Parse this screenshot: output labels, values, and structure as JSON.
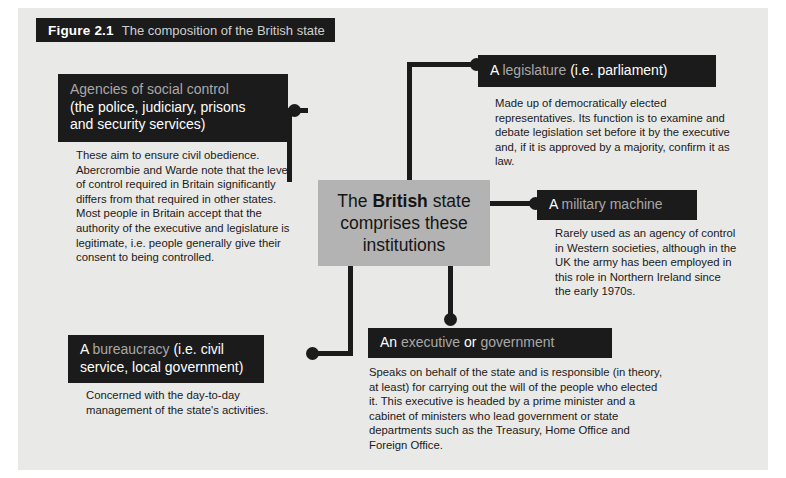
{
  "figure": {
    "number": "Figure 2.1",
    "caption": "The composition of the British state"
  },
  "center": {
    "line1_a": "The ",
    "line1_b": "British",
    "line1_c": " state",
    "line2": "comprises these",
    "line3": "institutions"
  },
  "nodes": [
    {
      "id": "agencies",
      "header_lines": [
        [
          {
            "t": "Agencies of social control",
            "s": "kw"
          }
        ],
        [
          {
            "t": "(the police, judiciary, prisons",
            "s": "wt"
          }
        ],
        [
          {
            "t": "and security services)",
            "s": "wt"
          }
        ]
      ],
      "body": "These aim to ensure civil obedience. Abercrombie and Warde note that the level of control required in Britain significantly differs from that required in other states. Most people in Britain accept that the authority of the executive and legislature is legitimate, i.e. people generally give their consent to being controlled."
    },
    {
      "id": "legislature",
      "header_lines": [
        [
          {
            "t": "A ",
            "s": "wt"
          },
          {
            "t": "legislature",
            "s": "kw"
          },
          {
            "t": " (i.e. parliament)",
            "s": "wt"
          }
        ]
      ],
      "body": "Made up of democratically elected representatives. Its function is to examine and debate legislation set before it by the executive and, if it is approved by a majority, confirm it as law."
    },
    {
      "id": "military",
      "header_lines": [
        [
          {
            "t": "A ",
            "s": "wt"
          },
          {
            "t": "military machine",
            "s": "kw"
          }
        ]
      ],
      "body": "Rarely used as an agency of control in Western societies, although in the UK the army has been employed in this role in Northern Ireland since the early 1970s."
    },
    {
      "id": "executive",
      "header_lines": [
        [
          {
            "t": "An ",
            "s": "wt"
          },
          {
            "t": "executive",
            "s": "kw"
          },
          {
            "t": " or ",
            "s": "wt"
          },
          {
            "t": "government",
            "s": "kw"
          }
        ]
      ],
      "body": "Speaks on behalf of the state and is responsible (in theory, at least) for carrying out the will of the people who elected it. This executive is headed by a prime minister and a cabinet of ministers who lead government or state departments such as the Treasury, Home Office and Foreign Office."
    },
    {
      "id": "bureaucracy",
      "header_lines": [
        [
          {
            "t": "A ",
            "s": "wt"
          },
          {
            "t": "bureaucracy",
            "s": "kw"
          },
          {
            "t": " (i.e. civil",
            "s": "wt"
          }
        ],
        [
          {
            "t": "service, local government)",
            "s": "wt"
          }
        ]
      ],
      "body": "Concerned with the day-to-day management of the state's activities."
    }
  ],
  "colors": {
    "panel_background": "#e9e9e7",
    "header_box": "#1b1b1b",
    "center_box": "#b3b3b3",
    "keyword_text": "#a8a8a8",
    "body_text": "#1a1a1a",
    "connector": "#1b1b1b"
  }
}
